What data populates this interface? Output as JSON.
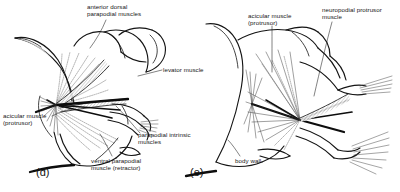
{
  "figure": {
    "kind": "anatomical-line-drawing",
    "background_color": "#ffffff",
    "ink_color": "#141414",
    "stipple_color": "#6e6e6e"
  },
  "panels": [
    {
      "id": "d",
      "letter": "(d)",
      "labels": [
        {
          "id": "anterior-dorsal-parapodial-muscles",
          "text": "anterior dorsal\nparapodial muscles"
        },
        {
          "id": "levator-muscle",
          "text": "levator muscle"
        },
        {
          "id": "acicular-muscle-protrusor",
          "text": "acicular muscle\n(protrusor)"
        },
        {
          "id": "parapodial-intrinsic-muscles",
          "text": "parapodial intrinsic\nmuscles"
        },
        {
          "id": "ventral-parapodial-muscle-retractor",
          "text": "ventral parapodial\nmuscle (retractor)"
        }
      ]
    },
    {
      "id": "e",
      "letter": "(e)",
      "labels": [
        {
          "id": "acicular-muscle-protrusor",
          "text": "acicular muscle\n(protrusor)"
        },
        {
          "id": "neuropodial-protrusor-muscle",
          "text": "neuropodial protrusor\nmuscle"
        },
        {
          "id": "body-wall",
          "text": "body wall"
        }
      ]
    }
  ],
  "labels": {
    "anterior_dorsal_parapodial_muscles_line1": "anterior dorsal",
    "anterior_dorsal_parapodial_muscles_line2": "parapodial muscles",
    "levator_muscle": "levator muscle",
    "acicular_muscle_line1": "acicular muscle",
    "acicular_muscle_line2": "(protrusor)",
    "parapodial_intrinsic_line1": "parapodial intrinsic",
    "parapodial_intrinsic_line2": "muscles",
    "ventral_parapodial_line1": "ventral parapodial",
    "ventral_parapodial_line2": "muscle (retractor)",
    "acicular_muscle_e_line1": "acicular muscle",
    "acicular_muscle_e_line2": "(protrusor)",
    "neuropodial_protrusor_line1": "neuropodial protrusor",
    "neuropodial_protrusor_line2": "muscle",
    "body_wall": "body wall",
    "panel_d_letter": "(d)",
    "panel_e_letter": "(e)"
  }
}
